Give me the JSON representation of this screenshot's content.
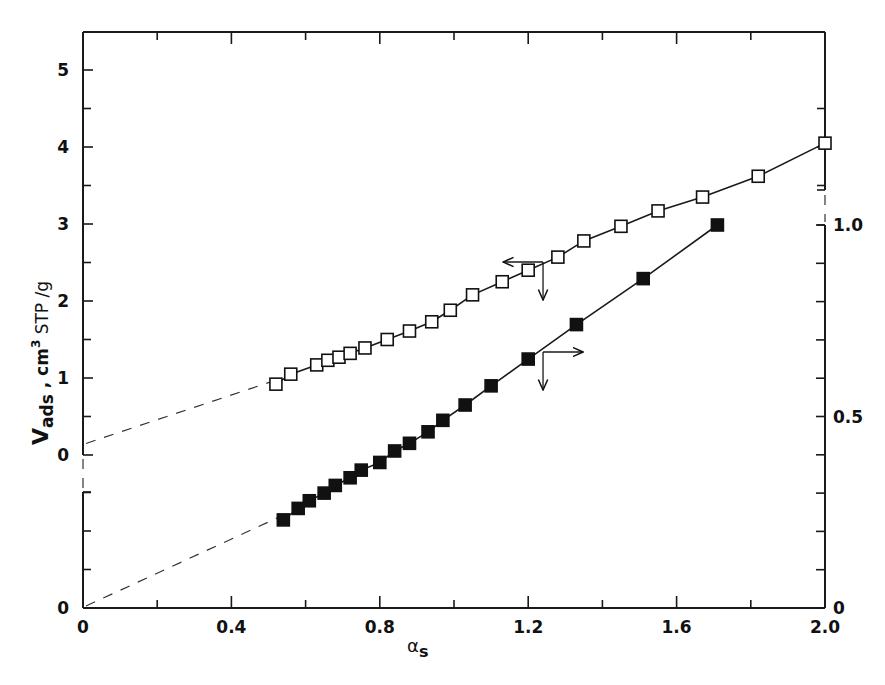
{
  "chart_data": {
    "type": "scatter",
    "title": "",
    "xlabel": "αs",
    "ylabel_left": "Vads , cm³ STP /g",
    "ylabel_right": "",
    "x_ticks": [
      "0",
      "0.4",
      "0.8",
      "1.2",
      "1.6",
      "2.0"
    ],
    "xlim": [
      0,
      2.0
    ],
    "left_axis": {
      "ylim": [
        0,
        5
      ],
      "ticks": [
        "0",
        "1",
        "2",
        "3",
        "4",
        "5"
      ],
      "lower_zero_label": "0",
      "note": "Axis broken below 0; lower segment has its own origin 0"
    },
    "right_axis": {
      "ylim": [
        0,
        1.0
      ],
      "ticks": [
        "0",
        "0.5",
        "1.0"
      ]
    },
    "grid": false,
    "legend": "none (arrows indicate axis: open squares → left axis, filled squares → right axis)",
    "series": [
      {
        "name": "open squares (left axis)",
        "marker": "open-square",
        "axis": "left",
        "x": [
          0.52,
          0.56,
          0.63,
          0.66,
          0.69,
          0.72,
          0.76,
          0.82,
          0.88,
          0.94,
          0.99,
          1.05,
          1.13,
          1.2,
          1.28,
          1.35,
          1.45,
          1.55,
          1.67,
          1.82,
          2.0
        ],
        "y": [
          0.92,
          1.05,
          1.17,
          1.23,
          1.27,
          1.32,
          1.39,
          1.5,
          1.61,
          1.73,
          1.88,
          2.08,
          2.25,
          2.4,
          2.57,
          2.78,
          2.97,
          3.17,
          3.35,
          3.62,
          4.05
        ]
      },
      {
        "name": "filled squares (right axis)",
        "marker": "filled-square",
        "axis": "right",
        "x": [
          0.54,
          0.58,
          0.61,
          0.65,
          0.68,
          0.72,
          0.75,
          0.8,
          0.84,
          0.88,
          0.93,
          0.97,
          1.03,
          1.1,
          1.2,
          1.33,
          1.51,
          1.71
        ],
        "y": [
          0.23,
          0.26,
          0.28,
          0.3,
          0.32,
          0.34,
          0.36,
          0.38,
          0.41,
          0.43,
          0.46,
          0.49,
          0.53,
          0.58,
          0.65,
          0.74,
          0.86,
          1.0
        ]
      }
    ],
    "extrapolations": [
      {
        "series": "open squares (left axis)",
        "style": "dashed",
        "from_x": 0,
        "to_x": 0.52,
        "intercept_y": 0.15
      },
      {
        "series": "filled squares (right axis)",
        "style": "dashed",
        "from_x": 0,
        "to_x": 0.54,
        "intercept_y": 0.0
      }
    ],
    "annotations": [
      {
        "type": "arrow",
        "direction": "left",
        "at_x": 1.24,
        "series": "open squares (left axis)"
      },
      {
        "type": "arrow",
        "direction": "down",
        "at_x": 1.24,
        "series": "open squares (left axis)"
      },
      {
        "type": "arrow",
        "direction": "right",
        "at_x": 1.24,
        "series": "filled squares (right axis)"
      },
      {
        "type": "arrow",
        "direction": "down",
        "at_x": 1.24,
        "series": "filled squares (right axis)"
      }
    ]
  },
  "labels": {
    "x_title_main": "α",
    "x_title_sub": "s",
    "y_title_v": "V",
    "y_title_sub": "ads",
    "y_title_rest": " ,  cm",
    "y_title_sup": "3",
    "y_title_unit": " STP /g"
  }
}
